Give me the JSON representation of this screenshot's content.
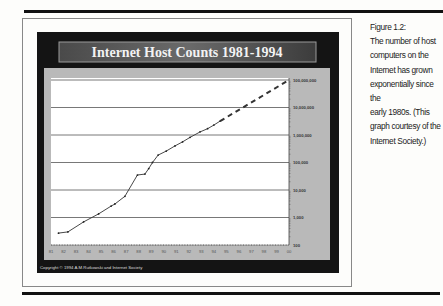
{
  "caption": {
    "label": "Figure 1.2:",
    "lines": [
      "The number of host",
      "computers on the",
      "Internet has grown",
      "exponentially since the",
      "early 1980s. (This",
      "graph courtesy of the",
      "Internet Society.)"
    ]
  },
  "copyright": "Copyright © 1994 A.M.Rutkowski and Internet Society",
  "colors": {
    "frame": "#141414",
    "panel": "#b9b9b9",
    "plot_bg": "#ffffff",
    "title_bar": "#5a5a5a",
    "line": "#333333",
    "grid": "#555555"
  },
  "chart_data": {
    "type": "line",
    "title": "Internet Host Counts 1981-1994",
    "xlabel": "",
    "ylabel": "",
    "yscale": "log",
    "ylim": [
      100,
      100000000
    ],
    "xlim": [
      1981,
      2000
    ],
    "grid": true,
    "y_axis_position": "right",
    "x_tick_labels": [
      "81",
      "82",
      "83",
      "84",
      "85",
      "86",
      "87",
      "88",
      "89",
      "90",
      "91",
      "92",
      "93",
      "94",
      "95",
      "96",
      "97",
      "98",
      "99",
      "00"
    ],
    "y_tick_labels": [
      "100",
      "1,000",
      "10,000",
      "100,000",
      "1,000,000",
      "10,000,000",
      "100,000,000"
    ],
    "y_tick_values": [
      100,
      1000,
      10000,
      100000,
      1000000,
      10000000,
      100000000
    ],
    "series": [
      {
        "name": "Actual host count",
        "style": "solid",
        "x": [
          1981.6,
          1982.35,
          1983.6,
          1984.8,
          1985.8,
          1986.1,
          1986.9,
          1987.9,
          1988.5,
          1988.8,
          1989.1,
          1989.55,
          1990.2,
          1990.9,
          1991.5,
          1992.1,
          1992.9,
          1993.5,
          1994.0,
          1994.5
        ],
        "y": [
          270,
          300,
          690,
          1350,
          2600,
          3100,
          5900,
          35000,
          38000,
          60000,
          100000,
          186000,
          260000,
          400000,
          560000,
          820000,
          1300000,
          1700000,
          2300000,
          3200000
        ]
      },
      {
        "name": "Projection",
        "style": "dashed",
        "x": [
          1994.5,
          2000.0
        ],
        "y": [
          3200000,
          100000000
        ]
      }
    ]
  }
}
